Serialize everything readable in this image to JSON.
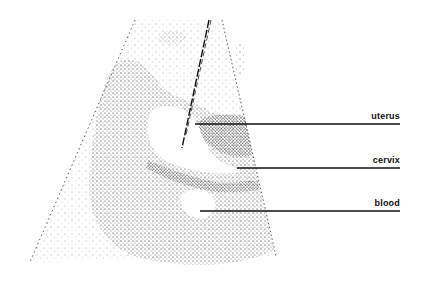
{
  "figure": {
    "labels": [
      {
        "text": "uterus",
        "line_y": 124,
        "line_x1": 195,
        "line_x2": 400,
        "label_right": 400,
        "label_y": 111
      },
      {
        "text": "cervix",
        "line_y": 168,
        "line_x1": 237,
        "line_x2": 400,
        "label_right": 400,
        "label_y": 155
      },
      {
        "text": "blood",
        "line_y": 211,
        "line_x1": 200,
        "line_x2": 400,
        "label_right": 400,
        "label_y": 198
      }
    ],
    "colors": {
      "ink": "#1a1a1a",
      "background": "#ffffff"
    }
  }
}
